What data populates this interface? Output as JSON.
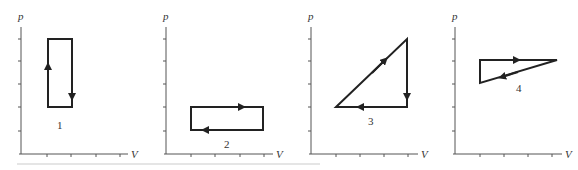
{
  "figure": {
    "axis_labels": {
      "y": "p",
      "x": "V"
    },
    "panels": [
      {
        "id": 1,
        "label": "1",
        "shape": "rectangle",
        "direction": "clockwise",
        "vertices_grid": [
          [
            1,
            1
          ],
          [
            2,
            1
          ],
          [
            2,
            4
          ],
          [
            1,
            4
          ]
        ],
        "description": "Tall rectangle; arrow up on left side, arrow down on right side"
      },
      {
        "id": 2,
        "label": "2",
        "shape": "rectangle",
        "direction": "clockwise",
        "vertices_grid": [
          [
            1,
            1
          ],
          [
            4,
            1
          ],
          [
            4,
            2
          ],
          [
            1,
            2
          ]
        ],
        "description": "Wide rectangle; arrow right on top side, arrow left on bottom side"
      },
      {
        "id": 3,
        "label": "3",
        "shape": "right-triangle",
        "direction": "clockwise",
        "vertices_grid": [
          [
            1,
            2
          ],
          [
            3,
            4
          ],
          [
            3,
            2
          ]
        ],
        "description": "Diagonal up-right, then vertical down, then horizontal left"
      },
      {
        "id": 4,
        "label": "4",
        "shape": "triangle",
        "direction": "clockwise",
        "vertices_grid": [
          [
            1,
            4
          ],
          [
            4.2,
            4
          ],
          [
            1,
            3
          ]
        ],
        "description": "Horizontal right along top, diagonal down-left, vertical up"
      }
    ]
  }
}
